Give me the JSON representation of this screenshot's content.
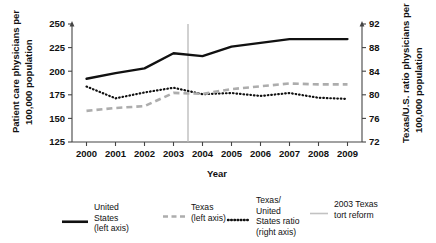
{
  "chart_data": {
    "type": "line",
    "title": "",
    "xlabel": "Year",
    "ylabel": "Patient care physicians per 100,000 population",
    "y2label": "Texas/U.S. ratio physicians per 100,000 population",
    "x": [
      2000,
      2001,
      2002,
      2003,
      2004,
      2005,
      2006,
      2007,
      2008,
      2009
    ],
    "xtick_labels": [
      "2000",
      "2001",
      "2002",
      "2003",
      "2004",
      "2005",
      "2006",
      "2007",
      "2008",
      "2009"
    ],
    "ylim": [
      125,
      250
    ],
    "ytick_labels": [
      "125",
      "150",
      "175",
      "200",
      "225",
      "250"
    ],
    "yticks": [
      125,
      150,
      175,
      200,
      225,
      250
    ],
    "y2lim": [
      72,
      92
    ],
    "y2tick_labels": [
      "72",
      "76",
      "80",
      "84",
      "88",
      "92"
    ],
    "y2ticks": [
      72,
      76,
      80,
      84,
      88,
      92
    ],
    "grid": false,
    "legend_position": "bottom",
    "series": [
      {
        "name": "United States (left axis)",
        "axis": "left",
        "style": "solid",
        "color": "#111111",
        "values": [
          192,
          198,
          203,
          219,
          216,
          226,
          230,
          234,
          234,
          234
        ]
      },
      {
        "name": "Texas (left axis)",
        "axis": "left",
        "style": "dashed",
        "color": "#adadad",
        "values": [
          158,
          161,
          163,
          177,
          176,
          181,
          184,
          187,
          186,
          186
        ]
      },
      {
        "name": "Texas/United States ratio (right axis)",
        "axis": "right",
        "style": "dotted",
        "color": "#111111",
        "values": [
          81.4,
          79.4,
          80.4,
          81.2,
          80.1,
          80.3,
          79.8,
          80.3,
          79.5,
          79.3
        ]
      }
    ],
    "annotations": [
      {
        "name": "2003 Texas tort reform",
        "type": "vline",
        "x": 2003.5,
        "color": "#b9b9b9"
      }
    ],
    "legend": [
      {
        "label_lines": [
          "United",
          "States",
          "(left axis)"
        ],
        "marker": "solid-line"
      },
      {
        "label_lines": [
          "Texas",
          "(left axis)"
        ],
        "marker": "dashed-line"
      },
      {
        "label_lines": [
          "Texas/",
          "United",
          "States ratio",
          "(right axis)"
        ],
        "marker": "dotted-line"
      },
      {
        "label_lines": [
          "2003 Texas",
          "tort reform"
        ],
        "marker": "thin-line"
      }
    ]
  }
}
